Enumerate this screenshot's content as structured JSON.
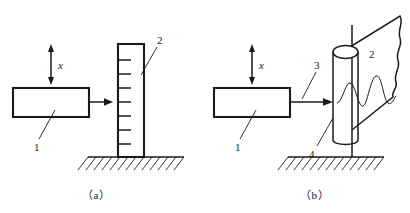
{
  "figure": {
    "panels": [
      {
        "id": "a",
        "caption": "（a）",
        "labels": {
          "block": "1",
          "target": "2",
          "displacement": "x"
        },
        "parts": [
          {
            "num": "1",
            "name": "sensor-block"
          },
          {
            "num": "2",
            "name": "graduated-column"
          }
        ]
      },
      {
        "id": "b",
        "caption": "（b）",
        "labels": {
          "block": "1",
          "sheet": "2",
          "beam": "3",
          "cylinder": "4",
          "displacement": "x"
        },
        "parts": [
          {
            "num": "1",
            "name": "sensor-block"
          },
          {
            "num": "2",
            "name": "torn-sheet"
          },
          {
            "num": "3",
            "name": "measuring-beam"
          },
          {
            "num": "4",
            "name": "rotating-cylinder"
          }
        ]
      }
    ],
    "colors": {
      "ink": "#1a1a1a",
      "background": "#ffffff"
    },
    "graduation_tick_count": 7
  }
}
